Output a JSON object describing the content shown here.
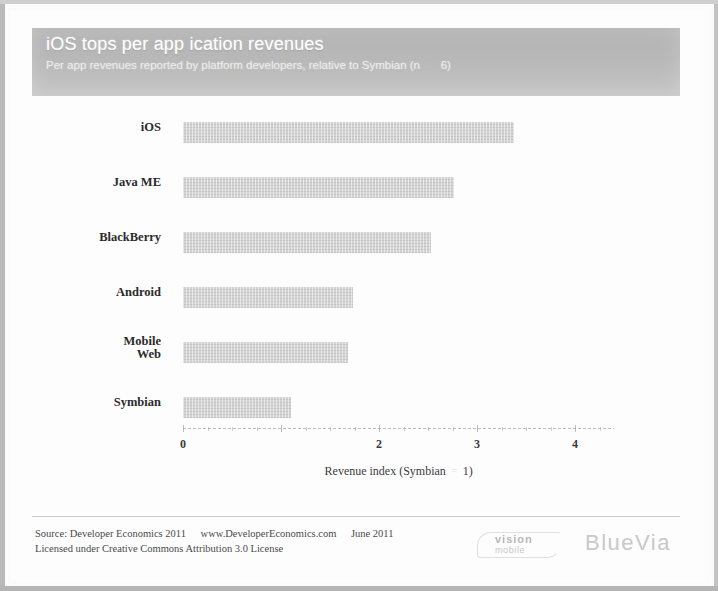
{
  "header": {
    "title": "iOS tops per app ication revenues",
    "subtitle_before": "Per app revenues reported by platform developers, relative to Symbian (n",
    "subtitle_eq": "=",
    "subtitle_after": "6)"
  },
  "axis": {
    "title_before": "Revenue index (Symbian",
    "title_eq": "=",
    "title_after": "1)",
    "tick_labels": [
      "0",
      "1",
      "2",
      "3",
      "4"
    ]
  },
  "footer": {
    "line1_source": "Source: Developer Economics 2011",
    "line1_url": "www.DeveloperEconomics.com",
    "line1_date": "June 2011",
    "line2": "Licensed under Creative Commons Attribution 3.0 License"
  },
  "logo": {
    "vision": "vision",
    "mobile": "mobile",
    "partner": "BlueVia"
  },
  "colors": {
    "header_band": "#b8b8b8",
    "bar_fill": "#d3d3d3",
    "text": "#2b2b2b",
    "axis": "#9a9a9a"
  },
  "chart_data": {
    "type": "bar",
    "orientation": "horizontal",
    "title": "iOS tops per app ication revenues",
    "subtitle": "Per app revenues reported by platform developers, relative to Symbian (n = 6)",
    "xlabel": "Revenue index (Symbian = 1)",
    "ylabel": "",
    "categories": [
      "iOS",
      "Java ME",
      "BlackBerry",
      "Android",
      "Mobile Web",
      "Symbian"
    ],
    "values": [
      3.38,
      2.77,
      2.53,
      1.73,
      1.68,
      1.1
    ],
    "xlim": [
      0,
      4.4
    ],
    "xticks": [
      0,
      1,
      2,
      3,
      4
    ],
    "xtick_labels_visible": [
      "0",
      "",
      "2",
      "3",
      "4"
    ],
    "grid": false,
    "legend": null,
    "source": "Developer Economics 2011, www.DeveloperEconomics.com, June 2011"
  }
}
